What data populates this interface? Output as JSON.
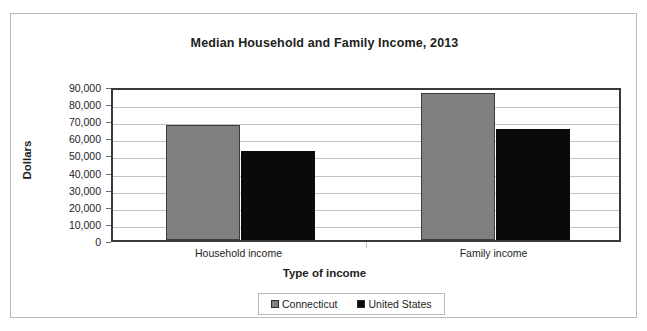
{
  "chart_data": {
    "type": "bar",
    "title": "Median Household and Family Income, 2013",
    "xlabel": "Type of income",
    "ylabel": "Dollars",
    "categories": [
      "Household income",
      "Family income"
    ],
    "series": [
      {
        "name": "Connecticut",
        "color": "#808080",
        "values": [
          67000,
          86000
        ]
      },
      {
        "name": "United States",
        "color": "#0a0a0a",
        "values": [
          52000,
          65000
        ]
      }
    ],
    "ylim": [
      0,
      90000
    ],
    "ytick_values": [
      0,
      10000,
      20000,
      30000,
      40000,
      50000,
      60000,
      70000,
      80000,
      90000
    ],
    "ytick_labels": [
      "0",
      "10,000",
      "20,000",
      "30,000",
      "40,000",
      "50,000",
      "60,000",
      "70,000",
      "80,000",
      "90,000"
    ],
    "grid": true,
    "legend_position": "bottom"
  },
  "legend": {
    "entries": [
      {
        "label": "Connecticut",
        "swatch": "gray-square-icon"
      },
      {
        "label": "United States",
        "swatch": "black-square-icon"
      }
    ]
  }
}
